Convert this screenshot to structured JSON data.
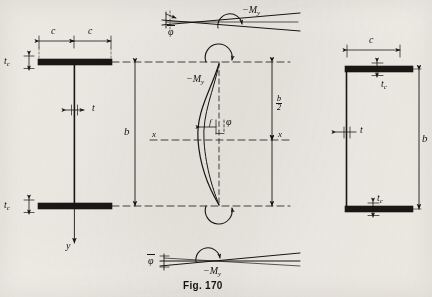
{
  "figure": {
    "caption": "Fig. 170",
    "background_color": "#f2f0ea",
    "ink_color": "#181612"
  },
  "panels": {
    "left_section": {
      "name": "I-beam cross section",
      "labels": {
        "flange_half_width_left": "c",
        "flange_half_width_right": "c",
        "flange_thickness": "t",
        "flange_thickness_sub": "c",
        "web_thickness": "t",
        "depth": "b",
        "axis_vertical": "y"
      }
    },
    "center_elevation": {
      "name": "buckled column elevation",
      "labels": {
        "moment_top": "−M",
        "moment_top_sub": "y",
        "half_depth_num": "b",
        "half_depth_den": "2",
        "axis_left": "x",
        "axis_right": "x",
        "deflection": "f",
        "rotation": "φ"
      }
    },
    "right_section": {
      "name": "channel cross section",
      "labels": {
        "flange_width": "c",
        "flange_thickness": "t",
        "flange_thickness_sub": "c",
        "flange_thickness_bottom": "t",
        "flange_thickness_bottom_sub": "c",
        "web_thickness": "t",
        "depth": "b"
      }
    },
    "top_detail": {
      "name": "top twist detail",
      "labels": {
        "rotation": "φ",
        "moment": "−M",
        "moment_sub": "y"
      }
    },
    "bottom_detail": {
      "name": "bottom twist detail",
      "labels": {
        "rotation": "φ",
        "moment": "−M",
        "moment_sub": "y"
      }
    }
  }
}
